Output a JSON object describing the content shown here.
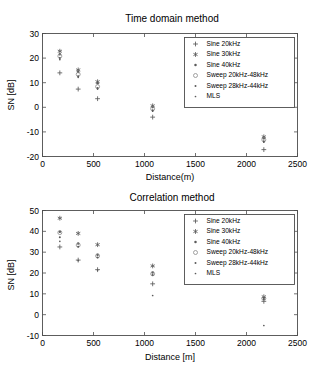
{
  "chart_data": [
    {
      "type": "scatter",
      "id": "time-domain",
      "title": "Time domain method",
      "xlabel": "Distance(m)",
      "ylabel": "SN [dB]",
      "xlim": [
        0,
        2500
      ],
      "ylim": [
        -20,
        30
      ],
      "xticks": [
        0,
        500,
        1000,
        1500,
        2000,
        2500
      ],
      "yticks": [
        -20,
        -10,
        0,
        10,
        20,
        30
      ],
      "grid": false,
      "legend_position": "upper right",
      "x": [
        170,
        350,
        540,
        1080,
        2170
      ],
      "series": [
        {
          "name": "Sine 20kHz",
          "marker": "plus",
          "values": [
            14.0,
            7.4,
            3.5,
            -4.0,
            -17.2
          ]
        },
        {
          "name": "Sine 30kHz",
          "marker": "asterisk",
          "values": [
            22.8,
            15.2,
            10.4,
            0.6,
            -12.0
          ]
        },
        {
          "name": "Sine 40kHz",
          "marker": "dot",
          "values": [
            21.6,
            14.4,
            9.8,
            0.1,
            -12.6
          ]
        },
        {
          "name": "Sweep 20kHz-48kHz",
          "marker": "circle",
          "values": [
            20.8,
            13.4,
            8.4,
            -0.6,
            -13.2
          ]
        },
        {
          "name": "Sweep 28kHz-44kHz",
          "marker": "small-dot",
          "values": [
            20.0,
            12.6,
            7.8,
            -1.2,
            -13.8
          ]
        },
        {
          "name": "MLS",
          "marker": "point",
          "values": [
            19.4,
            12.2,
            7.4,
            -1.6,
            -14.2
          ]
        }
      ]
    },
    {
      "type": "scatter",
      "id": "correlation",
      "title": "Correlation method",
      "xlabel": "Distance [m]",
      "ylabel": "SN [dB]",
      "xlim": [
        0,
        2500
      ],
      "ylim": [
        -10,
        50
      ],
      "xticks": [
        0,
        500,
        1000,
        1500,
        2000,
        2500
      ],
      "yticks": [
        -10,
        0,
        10,
        20,
        30,
        40,
        50
      ],
      "grid": false,
      "legend_position": "upper right",
      "x": [
        170,
        350,
        540,
        1080,
        2170
      ],
      "series": [
        {
          "name": "Sine 20kHz",
          "marker": "plus",
          "values": [
            32.5,
            26.2,
            21.6,
            14.8,
            6.4
          ]
        },
        {
          "name": "Sine 30kHz",
          "marker": "asterisk",
          "values": [
            46.3,
            39.0,
            33.6,
            23.4,
            8.6
          ]
        },
        {
          "name": "Sine 40kHz",
          "marker": "dot",
          "values": [
            39.8,
            34.2,
            28.8,
            20.2,
            8.2
          ]
        },
        {
          "name": "Sweep 20kHz-48kHz",
          "marker": "circle",
          "values": [
            39.4,
            33.4,
            28.2,
            19.6,
            7.8
          ]
        },
        {
          "name": "Sweep 28kHz-44kHz",
          "marker": "small-dot",
          "values": [
            37.2,
            32.6,
            27.4,
            19.0,
            7.4
          ]
        },
        {
          "name": "MLS",
          "marker": "point",
          "values": [
            35.2,
            26.0,
            21.4,
            9.2,
            -5.2
          ]
        }
      ]
    }
  ],
  "colors": {
    "axis": "#4d4d4d",
    "marker": "#5a5a5a",
    "marker_light": "#8a8a8a",
    "background": "#ffffff",
    "text": "#000000"
  }
}
